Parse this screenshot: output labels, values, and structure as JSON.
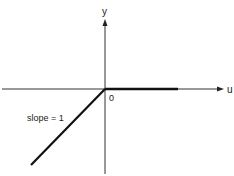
{
  "diagram": {
    "axes": {
      "x_label": "u",
      "y_label": "y",
      "origin_label": "0"
    },
    "annotations": {
      "slope_label": "slope = 1"
    },
    "function": {
      "description": "y = min(u, 0)",
      "segments": [
        {
          "name": "negative-branch",
          "from": [
            -1,
            -1
          ],
          "to": [
            0,
            0
          ],
          "slope": 1
        },
        {
          "name": "positive-branch",
          "from": [
            0,
            0
          ],
          "to": [
            1,
            0
          ],
          "slope": 0
        }
      ]
    },
    "colors": {
      "line": "#111111",
      "axis": "#333333",
      "background": "#ffffff"
    }
  }
}
